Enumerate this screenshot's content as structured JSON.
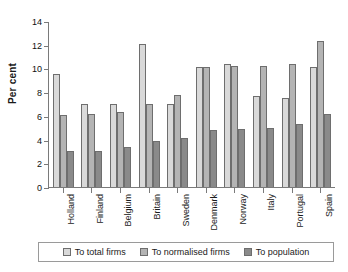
{
  "chart_data": {
    "type": "bar",
    "title": "",
    "subtitle": "",
    "xlabel": "",
    "ylabel": "Per cent",
    "ylim": [
      0,
      14
    ],
    "ytick_step": 2,
    "yticks": [
      0,
      2,
      4,
      6,
      8,
      10,
      12,
      14
    ],
    "ytick_labels": [
      "0",
      "2",
      "4",
      "6",
      "8",
      "10",
      "12",
      "14"
    ],
    "grid": false,
    "legend_position": "bottom",
    "categories": [
      "Holland",
      "Finland",
      "Belgium",
      "Britain",
      "Sweden",
      "Denmark",
      "Norway",
      "Italy",
      "Portugal",
      "Spain"
    ],
    "series": [
      {
        "name": "To total firms",
        "color": "#d9d9d9",
        "values": [
          9.5,
          7.0,
          7.0,
          12.1,
          7.0,
          10.1,
          10.4,
          7.7,
          7.5,
          10.1
        ]
      },
      {
        "name": "To normalised firms",
        "color": "#b4b4b4",
        "values": [
          6.1,
          6.2,
          6.3,
          7.0,
          7.8,
          10.1,
          10.2,
          10.2,
          10.4,
          12.3
        ]
      },
      {
        "name": "To population",
        "color": "#8a8a8a",
        "values": [
          3.0,
          3.0,
          3.4,
          3.9,
          4.1,
          4.8,
          4.9,
          5.0,
          5.3,
          6.2
        ]
      }
    ]
  },
  "axis": {
    "y_title": "Per cent"
  },
  "legend": {
    "entries": [
      {
        "label": "To total firms"
      },
      {
        "label": "To normalised firms"
      },
      {
        "label": "To population"
      }
    ]
  }
}
